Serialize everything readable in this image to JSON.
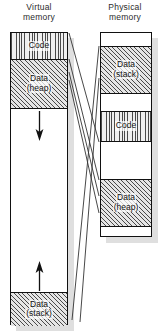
{
  "diagram": {
    "title_virtual": "Virtual",
    "title_virtual_2": "memory",
    "title_physical": "Physical",
    "title_physical_2": "memory",
    "colors": {
      "outline": "#111111",
      "hatch": "#4a4a4a",
      "shadow": "#d9d9d9",
      "background": "#ffffff",
      "mapping_line": "#333333"
    }
  },
  "virtual_memory": {
    "name": "Virtual memory",
    "segments": [
      {
        "id": "code",
        "label_line1": "Code",
        "label_line2": "",
        "fill": "vertical-hatch",
        "top": 0,
        "height": 26
      },
      {
        "id": "heap",
        "label_line1": "Data",
        "label_line2": "(heap)",
        "fill": "diagonal-hatch",
        "top": 26,
        "height": 49
      },
      {
        "id": "free-middle",
        "label_line1": "",
        "label_line2": "",
        "fill": "white",
        "top": 75,
        "height": 184
      },
      {
        "id": "stack",
        "label_line1": "Data",
        "label_line2": "(stack)",
        "fill": "diagonal-hatch",
        "top": 259,
        "height": 34
      }
    ],
    "arrows": [
      {
        "id": "heap-grow-down",
        "direction": "down",
        "label": "heap grows downward"
      },
      {
        "id": "stack-grow-up",
        "direction": "up",
        "label": "stack grows upward"
      }
    ]
  },
  "physical_memory": {
    "name": "Physical memory",
    "segments": [
      {
        "id": "free-top",
        "label_line1": "",
        "label_line2": "",
        "fill": "white",
        "top": 0,
        "height": 13
      },
      {
        "id": "stack",
        "label_line1": "Data",
        "label_line2": "(stack)",
        "fill": "diagonal-hatch",
        "top": 13,
        "height": 47
      },
      {
        "id": "free-mid-1",
        "label_line1": "",
        "label_line2": "",
        "fill": "white",
        "top": 60,
        "height": 18
      },
      {
        "id": "code",
        "label_line1": "Code",
        "label_line2": "",
        "fill": "vertical-hatch",
        "top": 78,
        "height": 30
      },
      {
        "id": "free-mid-2",
        "label_line1": "",
        "label_line2": "",
        "fill": "white",
        "top": 108,
        "height": 38
      },
      {
        "id": "heap",
        "label_line1": "Data",
        "label_line2": "(heap)",
        "fill": "diagonal-hatch",
        "top": 146,
        "height": 47
      },
      {
        "id": "free-bottom",
        "label_line1": "",
        "label_line2": "",
        "fill": "white",
        "top": 193,
        "height": 12
      }
    ]
  },
  "mappings": [
    {
      "id": "code-map",
      "from": "virtual.code",
      "to": "physical.code",
      "x1": 69,
      "y1": 33,
      "x2": 99,
      "y2": 142
    },
    {
      "id": "heap-map-1",
      "from": "virtual.heap",
      "to": "physical.heap",
      "x1": 69,
      "y1": 59,
      "x2": 99,
      "y2": 180
    },
    {
      "id": "heap-map-2",
      "from": "virtual.heap",
      "to": "physical.heap",
      "x1": 69,
      "y1": 72,
      "x2": 99,
      "y2": 196
    },
    {
      "id": "heap-map-3",
      "from": "virtual.heap",
      "to": "physical.heap",
      "x1": 69,
      "y1": 80,
      "x2": 99,
      "y2": 213
    },
    {
      "id": "stack-map-1",
      "from": "virtual.stack",
      "to": "physical.stack",
      "x1": 72,
      "y1": 320,
      "x2": 99,
      "y2": 46
    },
    {
      "id": "stack-map-2",
      "from": "virtual.stack",
      "to": "physical.stack",
      "x1": 80,
      "y1": 322,
      "x2": 99,
      "y2": 78
    }
  ]
}
